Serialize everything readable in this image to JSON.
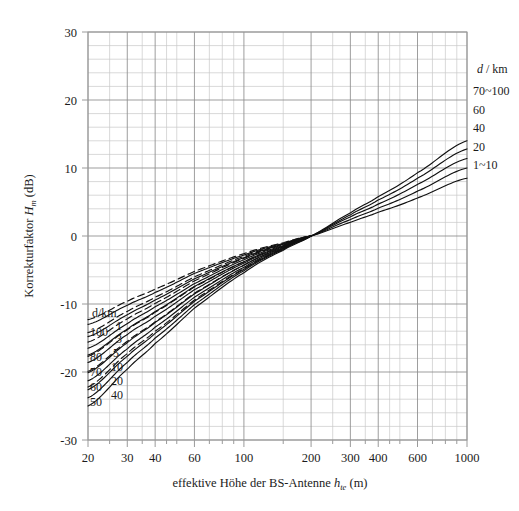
{
  "figure": {
    "background": "#ffffff",
    "frame_color": "#9a9a9a",
    "grid_major_color": "#8c8c8c",
    "grid_minor_color": "#c9c9c9",
    "curve_color": "#111111"
  },
  "axes": {
    "x": {
      "title_prefix": "effektive Höhe der BS-Antenne ",
      "title_symbol": "h",
      "title_subscript": "te",
      "title_suffix": " (m)",
      "scale": "log",
      "min": 20,
      "max": 1000,
      "tick_labels": [
        "20",
        "30",
        "40",
        "60",
        "100",
        "200",
        "300",
        "400",
        "600",
        "1000"
      ],
      "tick_values": [
        20,
        30,
        40,
        60,
        100,
        200,
        300,
        400,
        600,
        1000
      ],
      "minor_ticks": [
        20,
        25,
        30,
        35,
        40,
        45,
        50,
        60,
        70,
        80,
        90,
        100,
        150,
        200,
        250,
        300,
        350,
        400,
        450,
        500,
        600,
        700,
        800,
        900,
        1000
      ]
    },
    "y": {
      "title_prefix": "Korrekturfaktor ",
      "title_symbol": "H",
      "title_subscript": "m",
      "title_suffix": " (dB)",
      "scale": "linear",
      "min": -30,
      "max": 30,
      "tick_labels": [
        "30",
        "20",
        "10",
        "0",
        "-10",
        "-20",
        "-30"
      ],
      "tick_values": [
        30,
        20,
        10,
        0,
        -10,
        -20,
        -30
      ],
      "minor_step": 2
    },
    "grid": "on"
  },
  "legend_right": {
    "header_symbol": "d",
    "header_rest": " / km",
    "items": [
      "70~100",
      "60",
      "40",
      "20",
      "1~10"
    ]
  },
  "legend_left": {
    "header": "d/km",
    "column_outer": [
      "100",
      "80",
      "70",
      "60",
      "50"
    ],
    "column_inner": [
      "1",
      "3",
      "5",
      "10",
      "20",
      "40"
    ]
  },
  "chart_data": {
    "type": "line",
    "title": "",
    "xlabel": "effektive Höhe der BS-Antenne h_te (m)",
    "ylabel": "Korrekturfaktor H_m (dB)",
    "xscale": "log",
    "xlim": [
      20,
      1000
    ],
    "ylim": [
      -30,
      30
    ],
    "xticks": [
      20,
      30,
      40,
      60,
      100,
      200,
      300,
      400,
      600,
      1000
    ],
    "yticks": [
      -30,
      -20,
      -10,
      0,
      10,
      20,
      30
    ],
    "grid": true,
    "legend_position": "right-outside and inside-lower-left",
    "convergence_point": {
      "x": 200,
      "y": 0
    },
    "series": [
      {
        "name": "70~100",
        "style": "solid",
        "label_side": "right",
        "x": [
          20,
          30,
          40,
          60,
          100,
          150,
          200,
          300,
          400,
          600,
          1000
        ],
        "y": [
          -25.0,
          -19.6,
          -15.8,
          -10.6,
          -5.4,
          -2.1,
          0.0,
          3.4,
          5.8,
          9.3,
          14.0
        ]
      },
      {
        "name": "60",
        "style": "solid",
        "label_side": "right",
        "x": [
          20,
          30,
          40,
          60,
          100,
          150,
          200,
          300,
          400,
          600,
          1000
        ],
        "y": [
          -22.6,
          -17.7,
          -14.3,
          -9.6,
          -4.9,
          -1.9,
          0.0,
          3.1,
          5.3,
          8.5,
          12.8
        ]
      },
      {
        "name": "40",
        "style": "solid",
        "label_side": "right",
        "x": [
          20,
          30,
          40,
          60,
          100,
          150,
          200,
          300,
          400,
          600,
          1000
        ],
        "y": [
          -20.1,
          -15.7,
          -12.7,
          -8.5,
          -4.3,
          -1.7,
          0.0,
          2.8,
          4.7,
          7.6,
          11.4
        ]
      },
      {
        "name": "20",
        "style": "solid",
        "label_side": "right",
        "x": [
          20,
          30,
          40,
          60,
          100,
          150,
          200,
          300,
          400,
          600,
          1000
        ],
        "y": [
          -17.5,
          -13.7,
          -11.1,
          -7.4,
          -3.8,
          -1.5,
          0.0,
          2.4,
          4.1,
          6.6,
          10.0
        ]
      },
      {
        "name": "1~10",
        "style": "solid",
        "label_side": "right",
        "x": [
          20,
          30,
          40,
          60,
          100,
          150,
          200,
          300,
          400,
          600,
          1000
        ],
        "y": [
          -14.8,
          -11.6,
          -9.4,
          -6.3,
          -3.2,
          -1.2,
          0.0,
          2.0,
          3.5,
          5.6,
          8.5
        ]
      },
      {
        "name": "100",
        "style": "solid",
        "label_side": "left",
        "x": [
          20,
          30,
          40,
          60,
          100,
          150,
          200
        ],
        "y": [
          -13.0,
          -10.2,
          -8.3,
          -5.5,
          -2.8,
          -1.1,
          0.0
        ]
      },
      {
        "name": "80",
        "style": "solid",
        "label_side": "left",
        "x": [
          20,
          30,
          40,
          60,
          100,
          150,
          200
        ],
        "y": [
          -16.5,
          -12.9,
          -10.4,
          -7.0,
          -3.5,
          -1.4,
          0.0
        ]
      },
      {
        "name": "70",
        "style": "solid",
        "label_side": "left",
        "x": [
          20,
          30,
          40,
          60,
          100,
          150,
          200
        ],
        "y": [
          -18.6,
          -14.5,
          -11.8,
          -7.9,
          -4.0,
          -1.6,
          0.0
        ]
      },
      {
        "name": "60",
        "style": "solid",
        "label_side": "left",
        "x": [
          20,
          30,
          40,
          60,
          100,
          150,
          200
        ],
        "y": [
          -21.3,
          -16.6,
          -13.4,
          -9.0,
          -4.6,
          -1.8,
          0.0
        ]
      },
      {
        "name": "50",
        "style": "solid",
        "label_side": "left",
        "x": [
          20,
          30,
          40,
          60,
          100,
          150,
          200
        ],
        "y": [
          -23.8,
          -18.6,
          -15.0,
          -10.1,
          -5.1,
          -2.0,
          0.0
        ]
      },
      {
        "name": "1",
        "style": "dashed",
        "label_side": "left",
        "x": [
          20,
          30,
          40,
          60,
          100,
          150,
          200
        ],
        "y": [
          -12.3,
          -9.6,
          -7.8,
          -5.2,
          -2.6,
          -1.0,
          0.0
        ]
      },
      {
        "name": "3",
        "style": "dashed",
        "label_side": "left",
        "x": [
          20,
          30,
          40,
          60,
          100,
          150,
          200
        ],
        "y": [
          -14.2,
          -11.1,
          -9.0,
          -6.0,
          -3.0,
          -1.2,
          0.0
        ]
      },
      {
        "name": "5",
        "style": "dashed",
        "label_side": "left",
        "x": [
          20,
          30,
          40,
          60,
          100,
          150,
          200
        ],
        "y": [
          -15.6,
          -12.2,
          -9.9,
          -6.6,
          -3.3,
          -1.3,
          0.0
        ]
      },
      {
        "name": "10",
        "style": "dashed",
        "label_side": "left",
        "x": [
          20,
          30,
          40,
          60,
          100,
          150,
          200
        ],
        "y": [
          -17.7,
          -13.8,
          -11.2,
          -7.5,
          -3.8,
          -1.5,
          0.0
        ]
      },
      {
        "name": "20",
        "style": "dashed",
        "label_side": "left",
        "x": [
          20,
          30,
          40,
          60,
          100,
          150,
          200
        ],
        "y": [
          -19.9,
          -15.5,
          -12.6,
          -8.4,
          -4.3,
          -1.7,
          0.0
        ]
      },
      {
        "name": "40",
        "style": "dashed",
        "label_side": "left",
        "x": [
          20,
          30,
          40,
          60,
          100,
          150,
          200
        ],
        "y": [
          -22.2,
          -17.3,
          -14.0,
          -9.4,
          -4.8,
          -1.9,
          0.0
        ]
      }
    ]
  }
}
